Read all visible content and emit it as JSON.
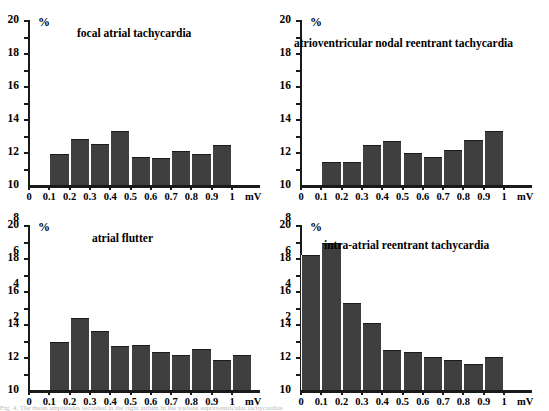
{
  "figure": {
    "background": "#ffffff",
    "bar_color": "#3f3f3f",
    "axis_color": "#1a1a1a",
    "y_unit": "%",
    "x_unit": "mV",
    "caption_partial": "Fig. 4.  The mean amplitudes recorded in the right atrium in the various supraventricular tachycardias"
  },
  "chart_data": [
    {
      "type": "bar",
      "title": "focal atrial tachycardia",
      "xlabel": "mV",
      "ylabel": "%",
      "ylim": [
        0,
        20
      ],
      "yticks": [
        2,
        4,
        6,
        8,
        10,
        12,
        14,
        16,
        18,
        20
      ],
      "xticks": [
        0,
        0.1,
        0.2,
        0.3,
        0.4,
        0.5,
        0.6,
        0.7,
        0.8,
        0.9,
        1
      ],
      "xtick_labels": [
        "0",
        "0.1",
        "0.2",
        "0.3",
        "0.4",
        "0.5",
        "0.6",
        "0.7",
        "0.8",
        "0.9",
        "1"
      ],
      "bin_starts": [
        0.1,
        0.2,
        0.3,
        0.4,
        0.5,
        0.6,
        0.7,
        0.8,
        0.9
      ],
      "bin_width": 0.1,
      "values": [
        3.8,
        5.6,
        5.0,
        6.6,
        3.4,
        3.3,
        4.1,
        3.8,
        4.8,
        2.5
      ],
      "grid": false,
      "legend": "none"
    },
    {
      "type": "bar",
      "title": "atrioventricular nodal reentrant tachycardia",
      "xlabel": "mV",
      "ylabel": "%",
      "ylim": [
        0,
        20
      ],
      "yticks": [
        2,
        4,
        6,
        8,
        10,
        12,
        14,
        16,
        18,
        20
      ],
      "xticks": [
        0,
        0.1,
        0.2,
        0.3,
        0.4,
        0.5,
        0.6,
        0.7,
        0.8,
        0.9,
        1
      ],
      "xtick_labels": [
        "0",
        "0.1",
        "0.2",
        "0.3",
        "0.4",
        "0.5",
        "0.6",
        "0.7",
        "0.8",
        "0.9",
        "1"
      ],
      "bin_starts": [
        0.1,
        0.2,
        0.3,
        0.4,
        0.5,
        0.6,
        0.7,
        0.8,
        0.9
      ],
      "bin_width": 0.1,
      "values": [
        2.8,
        2.85,
        4.85,
        5.35,
        3.9,
        3.35,
        4.3,
        5.4,
        6.5
      ],
      "grid": false,
      "legend": "none"
    },
    {
      "type": "bar",
      "title": "atrial flutter",
      "xlabel": "mV",
      "ylabel": "%",
      "ylim": [
        0,
        20
      ],
      "yticks": [
        2,
        4,
        6,
        8,
        10,
        12,
        14,
        16,
        18,
        20
      ],
      "xticks": [
        0,
        0.1,
        0.2,
        0.3,
        0.4,
        0.5,
        0.6,
        0.7,
        0.8,
        0.9,
        1
      ],
      "xtick_labels": [
        "0",
        "0.1",
        "0.2",
        "0.3",
        "0.4",
        "0.5",
        "0.6",
        "0.7",
        "0.8",
        "0.9",
        "1"
      ],
      "bin_starts": [
        0.1,
        0.2,
        0.3,
        0.4,
        0.5,
        0.6,
        0.7,
        0.8,
        0.9,
        1.0
      ],
      "bin_width": 0.1,
      "values": [
        5.8,
        8.7,
        7.1,
        5.3,
        5.5,
        4.6,
        4.2,
        5.0,
        3.6,
        4.3
      ],
      "grid": false,
      "legend": "none"
    },
    {
      "type": "bar",
      "title": "intra-atrial reentrant tachycardia",
      "xlabel": "mV",
      "ylabel": "%",
      "ylim": [
        0,
        20
      ],
      "yticks": [
        2,
        4,
        6,
        8,
        10,
        12,
        14,
        16,
        18,
        20
      ],
      "xticks": [
        0,
        0.1,
        0.2,
        0.3,
        0.4,
        0.5,
        0.6,
        0.7,
        0.8,
        0.9,
        1
      ],
      "xtick_labels": [
        "0",
        "0.1",
        "0.2",
        "0.3",
        "0.4",
        "0.5",
        "0.6",
        "0.7",
        "0.8",
        "0.9",
        "1"
      ],
      "bin_starts": [
        0.0,
        0.1,
        0.2,
        0.3,
        0.4,
        0.5,
        0.6,
        0.7,
        0.8,
        0.9
      ],
      "bin_width": 0.1,
      "values": [
        16.4,
        17.8,
        10.6,
        8.1,
        4.8,
        4.6,
        4.0,
        3.6,
        3.2,
        4.0
      ],
      "grid": false,
      "legend": "none"
    }
  ]
}
